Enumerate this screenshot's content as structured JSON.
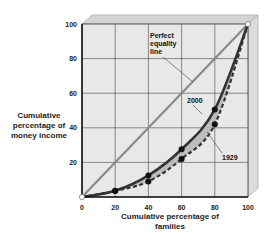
{
  "chart_data": {
    "type": "line",
    "title": "",
    "xlabel": "Cumulative percentage of families",
    "ylabel": "Cumulative percentage of money income",
    "xlim": [
      0,
      100
    ],
    "ylim": [
      0,
      100
    ],
    "x_ticks": [
      "0",
      "20",
      "40",
      "60",
      "80",
      "100"
    ],
    "y_ticks": [
      "20",
      "40",
      "60",
      "80",
      "100"
    ],
    "grid": true,
    "series": [
      {
        "name": "Perfect equality line",
        "style": "solid-gray",
        "x": [
          0,
          100
        ],
        "y": [
          0,
          100
        ]
      },
      {
        "name": "2000",
        "style": "solid-dark",
        "x": [
          0,
          20,
          40,
          60,
          80,
          100
        ],
        "y": [
          0,
          3.6,
          12.5,
          27.6,
          50.6,
          100
        ]
      },
      {
        "name": "1929",
        "style": "dashed-dark",
        "x": [
          0,
          20,
          40,
          60,
          80,
          100
        ],
        "y": [
          0,
          3.5,
          9.0,
          22.0,
          42.0,
          100
        ]
      }
    ],
    "annotations": [
      "Perfect equality line",
      "2000",
      "1929"
    ],
    "shaded_region": "area between 2000 and 1929 curves"
  },
  "labels": {
    "ylabel": "Cumulative percentage of money income",
    "xlabel": "Cumulative percentage of families",
    "ann_equality": [
      "Perfect",
      "equality",
      "line"
    ],
    "ann_2000": "2000",
    "ann_1929": "1929"
  },
  "colors": {
    "plot_bg": "#e8e8e8",
    "box_top": "#d4d4d4",
    "box_side": "#dcdcdc",
    "grid": "#444444",
    "equality": "#8a8a8a",
    "curve": "#333333",
    "shade": "#b8b8b8"
  }
}
